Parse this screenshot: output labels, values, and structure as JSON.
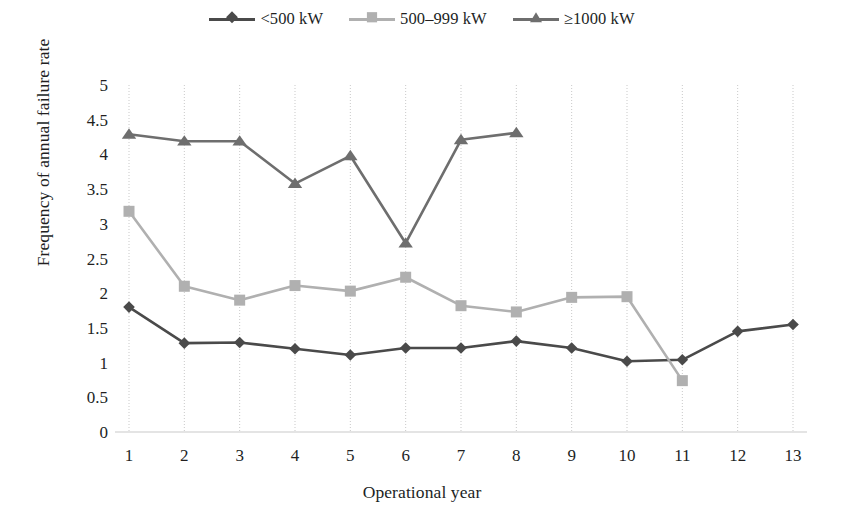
{
  "chart_data": {
    "type": "line",
    "title": "",
    "xlabel": "Operational year",
    "ylabel": "Frequency of annual failure rate",
    "x": [
      1,
      2,
      3,
      4,
      5,
      6,
      7,
      8,
      9,
      10,
      11,
      12,
      13
    ],
    "xtick_labels": [
      "1",
      "2",
      "3",
      "4",
      "5",
      "6",
      "7",
      "8",
      "9",
      "10",
      "11",
      "12",
      "13"
    ],
    "ytick_labels": [
      "0",
      "0.5",
      "1",
      "1.5",
      "2",
      "2.5",
      "3",
      "3.5",
      "4",
      "4.5",
      "5"
    ],
    "yticks": [
      0,
      0.5,
      1,
      1.5,
      2,
      2.5,
      3,
      3.5,
      4,
      4.5,
      5
    ],
    "ylim": [
      0,
      5
    ],
    "xlim": [
      1,
      13
    ],
    "grid": "vertical-dotted",
    "legend_position": "top-center",
    "series": [
      {
        "name": "<500 kW",
        "marker": "diamond",
        "color": "#4a4a4a",
        "x": [
          1,
          2,
          3,
          4,
          5,
          6,
          7,
          8,
          9,
          10,
          11,
          12,
          13
        ],
        "values": [
          1.8,
          1.28,
          1.29,
          1.2,
          1.11,
          1.21,
          1.21,
          1.31,
          1.21,
          1.02,
          1.04,
          1.45,
          1.55
        ]
      },
      {
        "name": "500–999 kW",
        "marker": "square",
        "color": "#b0b0b0",
        "x": [
          1,
          2,
          3,
          4,
          5,
          6,
          7,
          8,
          9,
          10,
          11
        ],
        "values": [
          3.18,
          2.1,
          1.9,
          2.11,
          2.03,
          2.23,
          1.82,
          1.73,
          1.94,
          1.95,
          0.74
        ]
      },
      {
        "name": "≥1000 kW",
        "marker": "triangle",
        "color": "#6e6e6e",
        "x": [
          1,
          2,
          3,
          4,
          5,
          6,
          7,
          8
        ],
        "values": [
          4.29,
          4.19,
          4.19,
          3.58,
          3.98,
          2.72,
          4.21,
          4.31
        ]
      }
    ]
  },
  "legend": {
    "items": [
      {
        "label": "<500 kW"
      },
      {
        "label": "500–999 kW"
      },
      {
        "label": "≥1000 kW"
      }
    ]
  },
  "axes": {
    "x_title": "Operational year",
    "y_title": "Frequency of annual failure rate"
  }
}
